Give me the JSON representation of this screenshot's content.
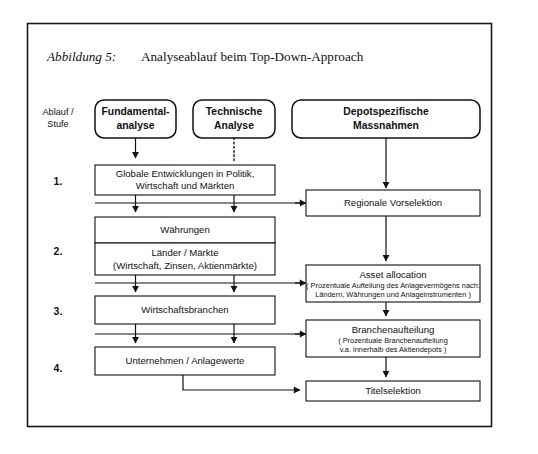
{
  "figure": {
    "label": "Abbildung 5:",
    "title": "Analyseablauf beim Top-Down-Approach"
  },
  "axis_label": {
    "line1": "Ablauf /",
    "line2": "Stufe"
  },
  "steps": [
    {
      "id": "step-1",
      "label": "1."
    },
    {
      "id": "step-2",
      "label": "2."
    },
    {
      "id": "step-3",
      "label": "3."
    },
    {
      "id": "step-4",
      "label": "4."
    }
  ],
  "headers": [
    {
      "id": "fundamentalanalyse",
      "line1": "Fundamental-",
      "line2": "analyse"
    },
    {
      "id": "technische-analyse",
      "line1": "Technische",
      "line2": "Analyse"
    },
    {
      "id": "depotspezifische-massnahmen",
      "line1": "Depotspezifische",
      "line2": "Massnahmen"
    }
  ],
  "left_column": [
    {
      "id": "globale-entwicklungen",
      "step": "1.",
      "line1": "Globale Entwicklungen in Politik,",
      "line2": "Wirtschaft und Märkten"
    },
    {
      "id": "waehrungen",
      "step": "2.",
      "line1": "Währungen"
    },
    {
      "id": "laender-maerkte",
      "step": "2.",
      "line1": "Länder / Märkte",
      "line2": "(Wirtschaft, Zinsen, Aktienmärkte)"
    },
    {
      "id": "wirtschaftsbranchen",
      "step": "3.",
      "line1": "Wirtschaftsbranchen"
    },
    {
      "id": "unternehmen-anlagewerte",
      "step": "4.",
      "line1": "Unternehmen / Anlagewerte"
    }
  ],
  "right_column": [
    {
      "id": "regionale-vorselektion",
      "line1": "Regionale Vorselektion"
    },
    {
      "id": "asset-allocation",
      "line1": "Asset allocation",
      "line2": "( Prozentuale Aufteilung des Anlagevermögens nach:",
      "line3": "Ländern, Währungen und Anlageinstrumenten )"
    },
    {
      "id": "branchenaufteilung",
      "line1": "Branchenaufteilung",
      "line2": "( Prozentuale Branchenaufteilung",
      "line3": "v.a. innerhalb des Aktiendepots )"
    },
    {
      "id": "titelselektion",
      "line1": "Titelselektion"
    }
  ],
  "colors": {
    "stroke": "#111111",
    "frame": "#1a1a1a",
    "background": "#ffffff"
  }
}
